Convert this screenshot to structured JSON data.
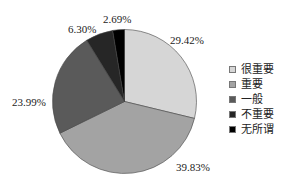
{
  "chart_data": {
    "type": "pie",
    "title": "",
    "start_angle_deg": -90,
    "direction": "clockwise",
    "center": [
      124.5,
      101.5
    ],
    "radius": 72,
    "slices": [
      {
        "label": "很重要",
        "value": 29.42,
        "display": "29.42%",
        "color": "#d6d6d6",
        "label_pos": [
          170,
          34
        ]
      },
      {
        "label": "重要",
        "value": 39.83,
        "display": "39.83%",
        "color": "#a3a3a3",
        "label_pos": [
          176,
          161
        ]
      },
      {
        "label": "一般",
        "value": 23.99,
        "display": "23.99%",
        "color": "#5a5a5a",
        "label_pos": [
          12,
          96
        ]
      },
      {
        "label": "不重要",
        "value": 6.3,
        "display": "6.30%",
        "color": "#262626",
        "label_pos": [
          68,
          23
        ]
      },
      {
        "label": "无所谓",
        "value": 2.69,
        "display": "2.69%",
        "color": "#000000",
        "label_pos": [
          103,
          13
        ]
      }
    ],
    "legend": {
      "position": "right",
      "entries": [
        "很重要",
        "重要",
        "一般",
        "不重要",
        "无所谓"
      ]
    }
  }
}
